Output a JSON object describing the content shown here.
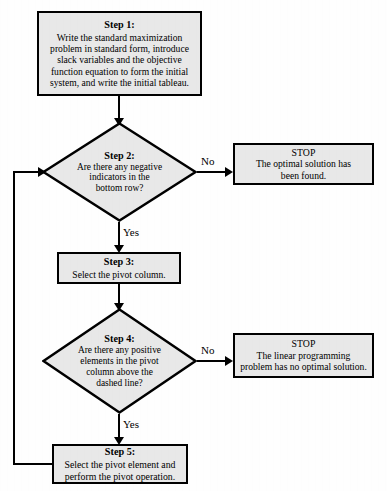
{
  "diagram": {
    "type": "flowchart",
    "colors": {
      "node_fill": "#e8e8e8",
      "node_border": "#000000",
      "connector": "#000000",
      "background": "#ffffff",
      "text": "#000000"
    },
    "nodes": [
      {
        "id": "step1",
        "shape": "rectangle",
        "title": "Step 1:",
        "body": "Write the standard maximization\nproblem in standard form, introduce\nslack variables and the objective\nfunction equation to form the initial\nsystem, and write the initial tableau."
      },
      {
        "id": "step2",
        "shape": "diamond",
        "title": "Step 2:",
        "body": "Are there any negative\nindicators in the\nbottom row?"
      },
      {
        "id": "stop1",
        "shape": "rectangle",
        "title": "STOP",
        "body": "The optimal solution has\nbeen found."
      },
      {
        "id": "step3",
        "shape": "rectangle",
        "title": "Step 3:",
        "body": "Select the pivot column."
      },
      {
        "id": "step4",
        "shape": "diamond",
        "title": "Step 4:",
        "body": "Are there any positive\nelements in the pivot\ncolumn above the\ndashed line?"
      },
      {
        "id": "stop2",
        "shape": "rectangle",
        "title": "STOP",
        "body": "The linear programming\nproblem has no optimal solution."
      },
      {
        "id": "step5",
        "shape": "rectangle",
        "title": "Step 5:",
        "body": "Select the pivot element and\nperform the pivot operation."
      }
    ],
    "edges": [
      {
        "id": "e1",
        "from": "step1",
        "to": "step2",
        "label": ""
      },
      {
        "id": "e2",
        "from": "step2",
        "to": "stop1",
        "label": "No"
      },
      {
        "id": "e3",
        "from": "step2",
        "to": "step3",
        "label": "Yes"
      },
      {
        "id": "e4",
        "from": "step3",
        "to": "step4",
        "label": ""
      },
      {
        "id": "e5",
        "from": "step4",
        "to": "stop2",
        "label": "No"
      },
      {
        "id": "e6",
        "from": "step4",
        "to": "step5",
        "label": "Yes"
      },
      {
        "id": "e7",
        "from": "step5",
        "to": "step2",
        "label": ""
      }
    ]
  }
}
